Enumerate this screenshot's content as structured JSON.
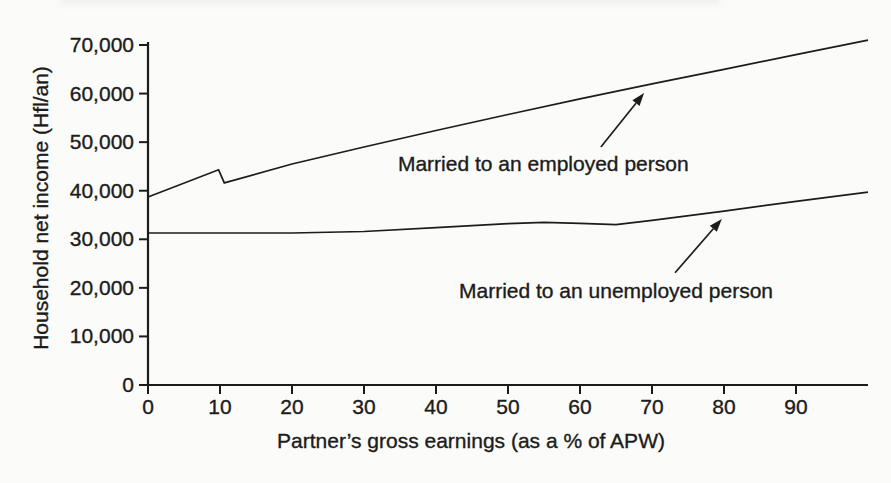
{
  "figure": {
    "background": "#fbfbf9",
    "ink_color": "#1c1c1c"
  },
  "chart_data": {
    "type": "line",
    "title": "",
    "xlabel": "Partner’s gross earnings (as a % of APW)",
    "ylabel": "Household net income (Hfl/an)",
    "xlim": [
      0,
      100
    ],
    "ylim": [
      0,
      70000
    ],
    "grid": false,
    "legend_position": "inline-annotations",
    "x_ticks": [
      {
        "value": 0,
        "label": "0"
      },
      {
        "value": 10,
        "label": "10"
      },
      {
        "value": 20,
        "label": "20"
      },
      {
        "value": 30,
        "label": "30"
      },
      {
        "value": 40,
        "label": "40"
      },
      {
        "value": 50,
        "label": "50"
      },
      {
        "value": 60,
        "label": "60"
      },
      {
        "value": 70,
        "label": "70"
      },
      {
        "value": 80,
        "label": "80"
      },
      {
        "value": 90,
        "label": "90"
      }
    ],
    "y_ticks": [
      {
        "value": 0,
        "label": "0"
      },
      {
        "value": 10000,
        "label": "10,000"
      },
      {
        "value": 20000,
        "label": "20,000"
      },
      {
        "value": 30000,
        "label": "30,000"
      },
      {
        "value": 40000,
        "label": "40,000"
      },
      {
        "value": 50000,
        "label": "50,000"
      },
      {
        "value": 60000,
        "label": "60,000"
      },
      {
        "value": 70000,
        "label": "70,000"
      }
    ],
    "series": [
      {
        "name": "Married to an employed person",
        "points": [
          [
            0,
            38700
          ],
          [
            9.8,
            44300
          ],
          [
            10.6,
            41600
          ],
          [
            20,
            45500
          ],
          [
            30,
            49000
          ],
          [
            40,
            52400
          ],
          [
            50,
            55700
          ],
          [
            60,
            58900
          ],
          [
            70,
            62000
          ],
          [
            80,
            65000
          ],
          [
            90,
            68000
          ],
          [
            100,
            71000
          ]
        ]
      },
      {
        "name": "Married to an unemployed person",
        "points": [
          [
            0,
            31300
          ],
          [
            10,
            31300
          ],
          [
            20,
            31300
          ],
          [
            30,
            31600
          ],
          [
            40,
            32400
          ],
          [
            50,
            33200
          ],
          [
            55,
            33500
          ],
          [
            60,
            33300
          ],
          [
            65,
            33000
          ],
          [
            70,
            33900
          ],
          [
            80,
            35800
          ],
          [
            90,
            37800
          ],
          [
            100,
            39700
          ]
        ]
      }
    ],
    "annotations": [
      {
        "label": "Married to an employed person",
        "text_at": [
          54.9,
          45700
        ],
        "arrow_from": [
          62.9,
          49000
        ],
        "arrow_to": [
          68.9,
          60100
        ]
      },
      {
        "label": "Married to an unemployed person",
        "text_at": [
          65.0,
          19600
        ],
        "arrow_from": [
          73.2,
          23100
        ],
        "arrow_to": [
          79.7,
          34200
        ]
      }
    ]
  }
}
